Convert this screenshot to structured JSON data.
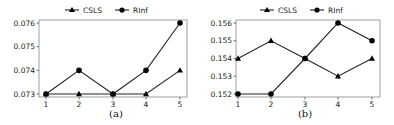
{
  "chart_data": [
    {
      "type": "line",
      "title": "",
      "caption": "(a)",
      "xlabel": "",
      "ylabel": "",
      "x": [
        1,
        2,
        3,
        4,
        5
      ],
      "xticks": [
        "1",
        "2",
        "3",
        "4",
        "5"
      ],
      "yticks": [
        "0.073",
        "0.074",
        "0.075",
        "0.076"
      ],
      "ylim": [
        0.073,
        0.076
      ],
      "grid": false,
      "legend_position": "top-center",
      "series": [
        {
          "name": "CSLS",
          "marker": "triangle",
          "values": [
            0.073,
            0.073,
            0.073,
            0.073,
            0.074
          ]
        },
        {
          "name": "RInf",
          "marker": "circle",
          "values": [
            0.073,
            0.074,
            0.073,
            0.074,
            0.076
          ]
        }
      ]
    },
    {
      "type": "line",
      "title": "",
      "caption": "(b)",
      "xlabel": "",
      "ylabel": "",
      "x": [
        1,
        2,
        3,
        4,
        5
      ],
      "xticks": [
        "1",
        "2",
        "3",
        "4",
        "5"
      ],
      "yticks": [
        "0.152",
        "0.153",
        "0.154",
        "0.155",
        "0.156"
      ],
      "ylim": [
        0.152,
        0.156
      ],
      "grid": false,
      "legend_position": "top-center",
      "series": [
        {
          "name": "CSLS",
          "marker": "triangle",
          "values": [
            0.154,
            0.155,
            0.154,
            0.153,
            0.154
          ]
        },
        {
          "name": "RInf",
          "marker": "circle",
          "values": [
            0.152,
            0.152,
            0.154,
            0.156,
            0.155
          ]
        }
      ]
    }
  ],
  "colors": {
    "line": "#222222",
    "axis": "#888888"
  }
}
